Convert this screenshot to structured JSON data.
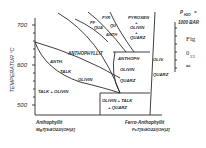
{
  "diagram": {
    "y_axis": {
      "label": "TEMPERATUR °C",
      "ticks": [
        "700",
        "600",
        "500"
      ]
    },
    "pressure_label_1": "P",
    "pressure_label_sub": "H2O",
    "pressure_label_eq": "=",
    "pressure_label_2": "1000 BAR",
    "side_text": {
      "fig": "Fig",
      "num": "0",
      "num_sub": "22",
      "as": "as"
    },
    "x_axis": {
      "left_name": "Anthophyllit",
      "left_formula": "Mg7[Si8O22/(OH)2]",
      "right_name": "Ferro-Anthophyllit",
      "right_formula": "Fe7[Si8O22/(OH)2]"
    },
    "fields": {
      "pyroxen": "PYROXEN",
      "pyroxen_dot": "+",
      "pyroxen_olivin": "OLIVIN",
      "pyroxen_dot2": "+",
      "pyroxen_quarz": "QUARZ",
      "pyr": "PYR",
      "qu": "QU",
      "pf": "PF",
      "qua": "QUA",
      "anth_small": "ANTH",
      "anthophyllit": "ANTHOPHYLLIT",
      "anth": "ANTH.",
      "talk": "TALK",
      "olivin": "OLIVIN",
      "talk_olivin": "TALK + OLIVIN",
      "anthoph": "ANTHOPH",
      "anthoph_olivin": "OLIVIN",
      "anthoph_quarz": "QUARZ",
      "oliv": "OLIV.",
      "oliv_quarz": "QUARZ",
      "olivin_talk": "OLIVIN + TALK",
      "olivin_talk_quarz": "+ QUARZ"
    }
  }
}
